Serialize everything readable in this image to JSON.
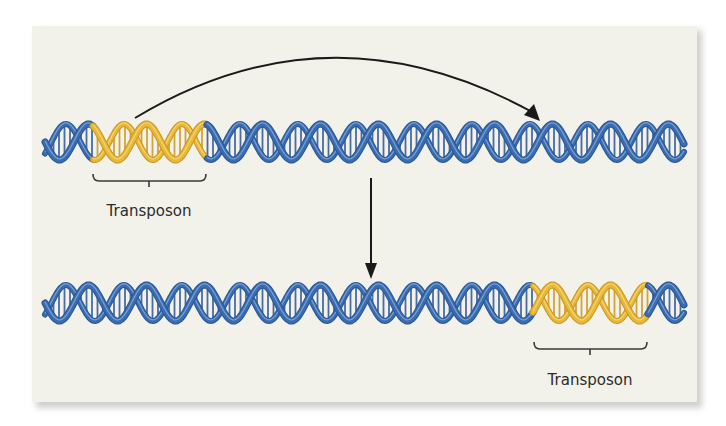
{
  "diagram": {
    "colors": {
      "background": "#f2f1ea",
      "dna_blue": "#3a6cb0",
      "dna_blue_dark": "#2a5596",
      "dna_blue_light": "#8fb1dd",
      "transposon_gold": "#e8b838",
      "transposon_gold_dark": "#c9971f",
      "transposon_gold_light": "#f6dc8a",
      "arrow": "#1a1a1a",
      "label": "#2b2b2b"
    },
    "top_strand": {
      "name": "original-dna",
      "x_start": 45,
      "x_end": 684,
      "y_center": 142,
      "amplitude": 18,
      "period": 58,
      "transposon": {
        "x_start": 93,
        "x_end": 207
      },
      "bracket": {
        "x_start": 93,
        "x_end": 206,
        "y": 181,
        "tick_x": 149
      },
      "label": {
        "text": "Transposon",
        "x": 149,
        "y": 216
      }
    },
    "bottom_strand": {
      "name": "resulting-dna",
      "x_start": 45,
      "x_end": 684,
      "y_center": 303,
      "amplitude": 18,
      "period": 58,
      "transposon": {
        "x_start": 533,
        "x_end": 648
      },
      "bracket": {
        "x_start": 534,
        "x_end": 647,
        "y": 349,
        "tick_x": 590
      },
      "label": {
        "text": "Transposon",
        "x": 590,
        "y": 385
      }
    },
    "curved_arrow": {
      "from": [
        135,
        118
      ],
      "control": [
        330,
        0
      ],
      "to": [
        540,
        121
      ],
      "meaning": "transposon moves to new location"
    },
    "down_arrow": {
      "x": 371,
      "y_start": 178,
      "y_end": 279,
      "meaning": "result after transposition"
    }
  }
}
